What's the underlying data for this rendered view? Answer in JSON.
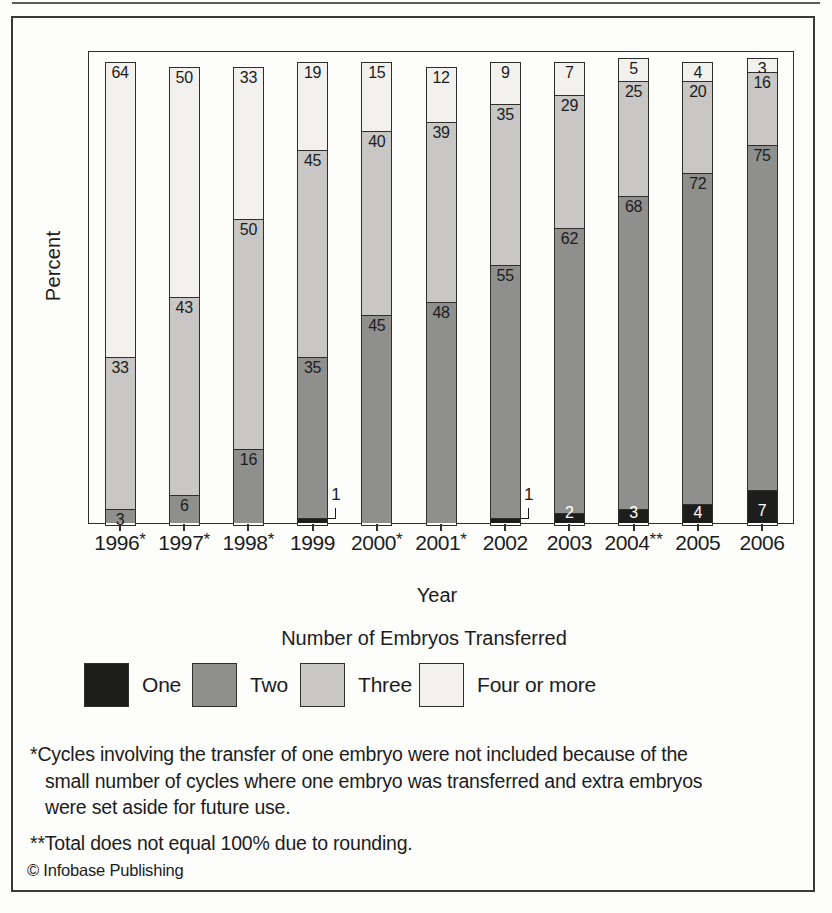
{
  "figure": {
    "copyright": "© Infobase Publishing"
  },
  "chart": {
    "y_axis_label": "Percent",
    "x_axis_title": "Year",
    "legend_title": "Number of Embryos Transferred",
    "footnotes": [
      "*Cycles involving the transfer of one embryo were not included because of the small number of cycles where one embryo was transferred and extra embryos were set aside for future use.",
      "**Total does not equal 100% due to rounding."
    ]
  },
  "chart_data": {
    "type": "bar",
    "stacked": true,
    "title": "",
    "xlabel": "Year",
    "ylabel": "Percent",
    "ylim": [
      0,
      100
    ],
    "grid": false,
    "legend_position": "bottom",
    "value_labels": "inside-top",
    "categories": [
      "1996*",
      "1997*",
      "1998*",
      "1999",
      "2000*",
      "2001*",
      "2002",
      "2003",
      "2004**",
      "2005",
      "2006"
    ],
    "series": [
      {
        "name": "One",
        "color": "#1d1d1b",
        "label_color": "#ffffff",
        "values": [
          null,
          null,
          null,
          1,
          null,
          null,
          1,
          2,
          3,
          4,
          7
        ]
      },
      {
        "name": "Two",
        "color": "#8f8f8d",
        "label_color": "#1c1c1c",
        "values": [
          3,
          6,
          16,
          35,
          45,
          48,
          55,
          62,
          68,
          72,
          75
        ]
      },
      {
        "name": "Three",
        "color": "#c8c7c5",
        "label_color": "#1c1c1c",
        "values": [
          33,
          43,
          50,
          45,
          40,
          39,
          35,
          29,
          25,
          20,
          16
        ]
      },
      {
        "name": "Four or more",
        "color": "#f2f1ee",
        "label_color": "#1c1c1c",
        "values": [
          64,
          50,
          33,
          19,
          15,
          12,
          9,
          7,
          5,
          4,
          3
        ]
      }
    ],
    "callouts": [
      {
        "category": "1999",
        "series": "One",
        "label": "1"
      },
      {
        "category": "2002",
        "series": "One",
        "label": "1"
      }
    ]
  }
}
